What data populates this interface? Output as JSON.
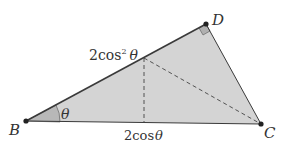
{
  "diagram": {
    "type": "geometry-triangle",
    "colors": {
      "fill": "#d4d4d4",
      "angle_fill": "#b8b8b8",
      "right_angle_fill": "#b0b0b0",
      "stroke": "#3a3a3a",
      "point": "#222222",
      "text": "#333333"
    },
    "points": {
      "B": {
        "label": "B",
        "x": 26,
        "y": 121
      },
      "D": {
        "label": "D",
        "x": 206,
        "y": 24
      },
      "C": {
        "label": "C",
        "x": 261,
        "y": 124
      },
      "E": {
        "x": 144,
        "y": 58
      },
      "F": {
        "x": 144,
        "y": 123
      }
    },
    "labels": {
      "B": "B",
      "D": "D",
      "C": "C",
      "angle": "θ",
      "side_BD": "2cos",
      "side_BD_sup": "2",
      "side_BD_theta": "θ",
      "side_BC": "2cos",
      "side_BC_theta": "θ"
    },
    "edges": [
      {
        "from": "B",
        "to": "D",
        "style": "solid"
      },
      {
        "from": "D",
        "to": "C",
        "style": "solid"
      },
      {
        "from": "B",
        "to": "C",
        "style": "solid"
      },
      {
        "from": "E",
        "to": "F",
        "style": "dashed"
      },
      {
        "from": "E",
        "to": "C",
        "style": "dashed"
      }
    ],
    "annotations": {
      "right_angle_at": "D",
      "angle_at": "B"
    }
  }
}
